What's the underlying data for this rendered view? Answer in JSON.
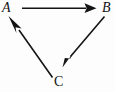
{
  "diagram": {
    "type": "directed-graph",
    "background_color": "#fdfdfd",
    "stroke_color": "#141414",
    "nodes": [
      {
        "id": "A",
        "label": "A",
        "style": "italic",
        "x": 8,
        "y": 8
      },
      {
        "id": "B",
        "label": "B",
        "style": "italic",
        "x": 107,
        "y": 8
      },
      {
        "id": "C",
        "label": "C",
        "style": "roman",
        "x": 59,
        "y": 81
      }
    ],
    "edges": [
      {
        "id": "A-to-B",
        "from": "A",
        "to": "B",
        "label": "",
        "direction": "right",
        "arrowhead": "filled-triangle"
      },
      {
        "id": "B-to-C",
        "from": "B",
        "to": "C",
        "label": "",
        "direction": "down-left",
        "arrowhead": "filled-triangle"
      },
      {
        "id": "C-to-A",
        "from": "C",
        "to": "A",
        "label": "",
        "direction": "up-left",
        "arrowhead": "filled-triangle"
      }
    ]
  }
}
